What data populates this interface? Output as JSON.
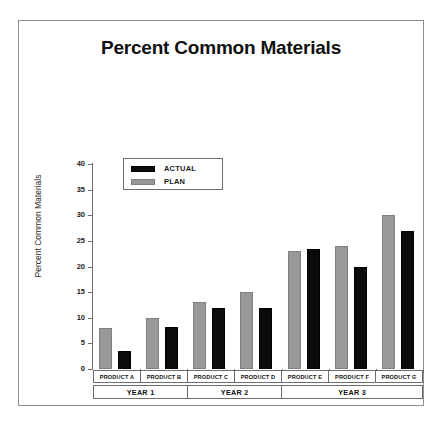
{
  "chart_data": {
    "type": "bar",
    "title": "Percent Common Materials",
    "xlabel": "",
    "ylabel": "Percent Common Materials",
    "ylim": [
      0,
      40
    ],
    "yticks": [
      0,
      5,
      10,
      15,
      20,
      25,
      30,
      35,
      40
    ],
    "grid": false,
    "legend_position": "top-left-inside",
    "categories": [
      "PRODUCT A",
      "PRODUCT B",
      "PRODUCT C",
      "PRODUCT D",
      "PRODUCT E",
      "PRODUCT F",
      "PRODUCT G"
    ],
    "groups": [
      {
        "label": "YEAR 1",
        "span": 2
      },
      {
        "label": "YEAR 2",
        "span": 2
      },
      {
        "label": "YEAR 3",
        "span": 3
      }
    ],
    "series": [
      {
        "name": "PLAN",
        "color": "#999999",
        "values": [
          8,
          10,
          13,
          15,
          23,
          24,
          30
        ]
      },
      {
        "name": "ACTUAL",
        "color": "#0b0b0b",
        "values": [
          3.5,
          8.2,
          12,
          12,
          23.5,
          20,
          27
        ]
      }
    ]
  },
  "legend": {
    "items": [
      {
        "label": "ACTUAL",
        "swatch": "actual"
      },
      {
        "label": "PLAN",
        "swatch": "plan"
      }
    ]
  },
  "colors": {
    "plan": "#999999",
    "actual": "#0b0b0b",
    "axis": "#6d6d6d",
    "frame": "#8f8f8f",
    "text": "#111111",
    "background": "#ffffff"
  }
}
